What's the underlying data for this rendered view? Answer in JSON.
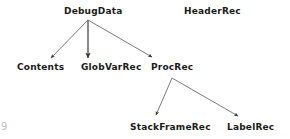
{
  "diagram": {
    "type": "directed-graph",
    "title": "",
    "background_color": "#ffffff",
    "edge_color": "#555555",
    "text_color": "#1a1a1a",
    "nodes": [
      {
        "id": "debugdata",
        "label": "DebugData",
        "x": 64,
        "y": 6,
        "level": 0
      },
      {
        "id": "headerrec",
        "label": "HeaderRec",
        "x": 184,
        "y": 6,
        "level": 0
      },
      {
        "id": "contents",
        "label": "Contents",
        "x": 17,
        "y": 62,
        "level": 1
      },
      {
        "id": "globvarrec",
        "label": "GlobVarRec",
        "x": 81,
        "y": 62,
        "level": 1
      },
      {
        "id": "procrec",
        "label": "ProcRec",
        "x": 151,
        "y": 62,
        "level": 1
      },
      {
        "id": "stackframerec",
        "label": "StackFrameRec",
        "x": 130,
        "y": 122,
        "level": 2
      },
      {
        "id": "labelrec",
        "label": "LabelRec",
        "x": 227,
        "y": 122,
        "level": 2
      }
    ],
    "edges": [
      {
        "from": "debugdata",
        "to": "contents",
        "x1": 88,
        "y1": 20,
        "x2": 51,
        "y2": 58
      },
      {
        "from": "debugdata",
        "to": "globvarrec",
        "x1": 88,
        "y1": 20,
        "x2": 88,
        "y2": 59
      },
      {
        "from": "debugdata",
        "to": "procrec",
        "x1": 88,
        "y1": 20,
        "x2": 152,
        "y2": 57
      },
      {
        "from": "procrec",
        "to": "stackframerec",
        "x1": 172,
        "y1": 78,
        "x2": 156,
        "y2": 116
      },
      {
        "from": "procrec",
        "to": "labelrec",
        "x1": 172,
        "y1": 78,
        "x2": 238,
        "y2": 117
      }
    ],
    "corner_artifact": "9"
  }
}
